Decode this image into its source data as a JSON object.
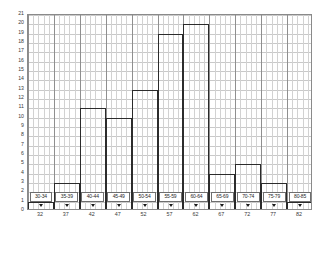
{
  "chart_data": {
    "type": "bar",
    "title": "",
    "subtitle": "",
    "xlabel": "",
    "ylabel": "",
    "categories": [
      "30-34",
      "35-39",
      "40-44",
      "45-49",
      "50-54",
      "55-59",
      "60-64",
      "65-69",
      "70-74",
      "75-79",
      "80-85"
    ],
    "midpoints": [
      32,
      37,
      42,
      47,
      52,
      57,
      62,
      67,
      72,
      77,
      82
    ],
    "values": [
      1,
      3,
      11,
      10,
      13,
      19,
      20,
      4,
      5,
      3,
      1
    ],
    "ylim": [
      0,
      21
    ],
    "ytick_labels": [
      "0",
      "1",
      "2",
      "3",
      "4",
      "5",
      "6",
      "7",
      "8",
      "9",
      "10",
      "11",
      "12",
      "13",
      "14",
      "15",
      "16",
      "17",
      "18",
      "19",
      "20",
      "21"
    ],
    "xtick_labels": [
      "32",
      "37",
      "42",
      "47",
      "52",
      "57",
      "62",
      "67",
      "72",
      "77",
      "82"
    ],
    "grid": true,
    "legend": "none",
    "bar_fill": "#ffffff",
    "bar_stroke": "#2b2b2b",
    "grid_color": "#c9c9c9",
    "axis_color": "#8a8a8a",
    "marker_icon": "down-triangle-marker",
    "marker_color": "#1a1a1a"
  }
}
